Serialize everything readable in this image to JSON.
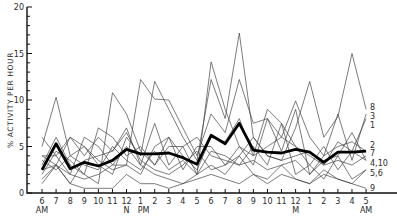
{
  "chart_data": {
    "type": "line",
    "title": "",
    "xlabel": "",
    "ylabel": "% ACTIVITY PER HOUR",
    "ylim": [
      0,
      20
    ],
    "yticks": [
      0,
      5,
      10,
      15,
      20
    ],
    "grid": false,
    "legend_position": "right-end-labels",
    "x": [
      "6",
      "7",
      "8",
      "9",
      "10",
      "11",
      "12",
      "1",
      "2",
      "3",
      "4",
      "5",
      "6",
      "7",
      "8",
      "9",
      "10",
      "11",
      "12",
      "1",
      "2",
      "3",
      "4",
      "5"
    ],
    "x_sublabels": {
      "0": "AM",
      "6": "N",
      "7": "PM",
      "18": "M",
      "23": "AM"
    },
    "mean_series": {
      "name": "mean",
      "values": [
        2.5,
        5.3,
        2.6,
        3.3,
        2.9,
        3.5,
        4.7,
        4.2,
        4.2,
        4.3,
        3.8,
        3.1,
        6.2,
        5.3,
        7.5,
        4.6,
        4.4,
        4.3,
        4.7,
        4.4,
        3.3,
        4.4,
        4.4,
        4.5
      ]
    },
    "series": [
      {
        "name": "1",
        "values": [
          4.0,
          3.0,
          6.0,
          5.0,
          3.5,
          2.5,
          3.0,
          12.2,
          10.1,
          10.0,
          7.0,
          4.0,
          8.5,
          6.5,
          12.2,
          7.5,
          8.0,
          6.0,
          5.0,
          4.0,
          3.0,
          5.5,
          4.5,
          8.0
        ]
      },
      {
        "name": "2",
        "values": [
          2.0,
          4.5,
          3.5,
          2.0,
          1.0,
          10.8,
          8.5,
          4.5,
          3.0,
          6.0,
          4.0,
          2.5,
          6.0,
          5.5,
          8.0,
          4.0,
          9.0,
          7.5,
          5.0,
          3.0,
          1.5,
          4.0,
          6.5,
          3.5
        ]
      },
      {
        "name": "3",
        "values": [
          6.0,
          4.0,
          6.0,
          4.0,
          6.0,
          4.5,
          7.0,
          3.0,
          7.5,
          3.0,
          5.0,
          2.0,
          14.1,
          9.0,
          5.0,
          3.0,
          8.0,
          4.5,
          9.0,
          2.0,
          4.0,
          8.5,
          3.5,
          8.5
        ]
      },
      {
        "name": "4",
        "values": [
          3.0,
          6.0,
          3.0,
          2.0,
          7.0,
          6.0,
          4.0,
          5.0,
          3.0,
          5.0,
          5.0,
          6.0,
          4.0,
          3.5,
          3.0,
          5.0,
          3.0,
          7.5,
          2.0,
          3.0,
          5.0,
          2.5,
          4.5,
          3.5
        ]
      },
      {
        "name": "5",
        "values": [
          1.0,
          3.0,
          2.0,
          1.5,
          2.0,
          3.0,
          5.0,
          3.0,
          2.0,
          1.5,
          1.0,
          2.0,
          3.0,
          2.0,
          4.0,
          2.0,
          1.5,
          3.0,
          1.5,
          1.0,
          2.5,
          1.5,
          1.0,
          2.5
        ]
      },
      {
        "name": "6",
        "values": [
          3.5,
          2.5,
          4.0,
          3.0,
          2.5,
          5.0,
          3.5,
          2.5,
          4.5,
          2.5,
          3.5,
          2.0,
          4.5,
          4.0,
          3.0,
          3.5,
          2.5,
          3.0,
          3.5,
          2.0,
          3.5,
          4.0,
          1.5,
          2.5
        ]
      },
      {
        "name": "7",
        "values": [
          2.5,
          3.0,
          1.0,
          3.5,
          4.0,
          4.5,
          6.5,
          3.5,
          2.5,
          2.0,
          3.0,
          4.5,
          2.5,
          3.0,
          5.0,
          4.0,
          5.0,
          6.0,
          9.9,
          6.0,
          4.0,
          5.0,
          5.5,
          4.5
        ]
      },
      {
        "name": "8",
        "values": [
          5.0,
          10.3,
          4.0,
          5.0,
          3.0,
          2.0,
          6.0,
          4.0,
          12.0,
          9.0,
          6.0,
          3.5,
          12.2,
          8.0,
          17.2,
          6.0,
          4.0,
          3.5,
          7.0,
          12.0,
          6.0,
          8.2,
          15.0,
          9.0
        ]
      },
      {
        "name": "9",
        "values": [
          1.5,
          3.0,
          1.0,
          0.5,
          0.5,
          0.5,
          2.0,
          1.0,
          1.0,
          0.5,
          1.0,
          1.5,
          2.0,
          1.5,
          1.0,
          2.0,
          1.0,
          2.0,
          1.5,
          1.0,
          2.0,
          1.5,
          1.0,
          0.5
        ]
      },
      {
        "name": "10",
        "values": [
          4.0,
          4.0,
          2.0,
          6.0,
          5.0,
          3.0,
          3.0,
          2.0,
          5.0,
          6.0,
          2.5,
          5.0,
          5.0,
          3.0,
          4.0,
          6.0,
          4.0,
          3.5,
          4.0,
          4.5,
          3.0,
          3.5,
          3.0,
          4.0
        ]
      }
    ],
    "end_labels": [
      {
        "text": "8",
        "y_value": 9.2
      },
      {
        "text": "3",
        "y_value": 8.3
      },
      {
        "text": "1",
        "y_value": 7.3
      },
      {
        "text": "2",
        "y_value": 5.2
      },
      {
        "text": "7",
        "y_value": 4.3
      },
      {
        "text": "4,10",
        "y_value": 3.2
      },
      {
        "text": "5,6",
        "y_value": 2.1
      },
      {
        "text": "9",
        "y_value": 0.5
      }
    ]
  },
  "axis": {
    "ylabel": "% ACTIVITY PER HOUR",
    "ytick_labels": [
      "0",
      "5",
      "10",
      "15",
      "20"
    ]
  }
}
